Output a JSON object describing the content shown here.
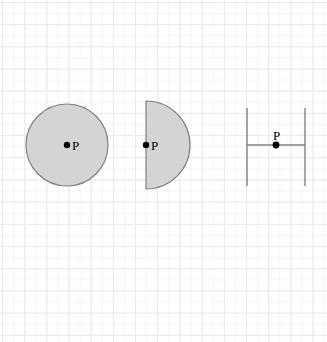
{
  "figure": {
    "background": {
      "name": "graph-paper-grid",
      "paper_color": "#ffffff",
      "minor_line_color": "#f4f4f4",
      "major_line_color": "#e9e9e9",
      "minor_spacing_px": 11.1,
      "major_spacing_px": 22.2
    },
    "style": {
      "shape_fill": "#d4d4d4",
      "shape_stroke": "#808080",
      "line_stroke": "#808080",
      "point_color": "#000000",
      "label_color": "#000000"
    },
    "shapes": [
      {
        "id": "circle",
        "type": "circle",
        "name": "filled-circle",
        "center_x": 67,
        "center_y": 145,
        "radius": 41,
        "fill": "#d4d4d4",
        "stroke": "#808080",
        "stroke_width": 1.2,
        "point": {
          "label": "P",
          "x": 67,
          "y": 145,
          "radius": 3.2,
          "label_offset_x": 5,
          "label_offset_y": -6,
          "position_description": "center of circle"
        }
      },
      {
        "id": "semicircle",
        "type": "semicircle",
        "name": "filled-semicircle",
        "center_x": 146,
        "center_y": 145,
        "radius": 44,
        "flat_edge": "left",
        "fill": "#d4d4d4",
        "stroke": "#808080",
        "stroke_width": 1.2,
        "point": {
          "label": "P",
          "x": 146,
          "y": 145,
          "radius": 3.2,
          "label_offset_x": 5,
          "label_offset_y": -6,
          "position_description": "midpoint of flat diameter edge"
        }
      },
      {
        "id": "parallel-lines",
        "type": "parallel-lines-with-transversal",
        "name": "parallel-lines-figure",
        "stroke": "#808080",
        "stroke_width": 1.4,
        "left_line": {
          "x": 247,
          "y1": 108,
          "y2": 186
        },
        "right_line": {
          "x": 305,
          "y1": 108,
          "y2": 186
        },
        "horizontal_segment": {
          "x1": 247,
          "x2": 305,
          "y": 145
        },
        "point": {
          "label": "P",
          "x": 276,
          "y": 145,
          "radius": 3.4,
          "label_offset_x": -3,
          "label_offset_y": -16,
          "position_description": "midpoint of horizontal segment between the two vertical lines"
        }
      }
    ],
    "labels": {
      "point_p": "P"
    }
  }
}
